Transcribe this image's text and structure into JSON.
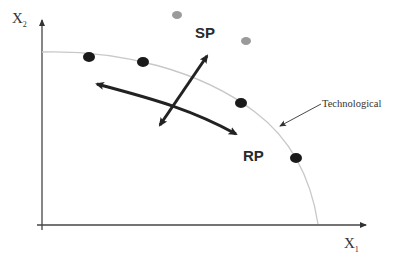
{
  "diagram": {
    "type": "production-possibility-frontier",
    "axes": {
      "x": {
        "label": "X",
        "subscript": "1"
      },
      "y": {
        "label": "X",
        "subscript": "2"
      }
    },
    "frontier": {
      "label": "Technological",
      "color": "#c8c8c8"
    },
    "labels": {
      "sp": "SP",
      "rp": "RP"
    },
    "points": {
      "on_frontier": [
        {
          "x": 89,
          "y": 57
        },
        {
          "x": 143,
          "y": 62
        },
        {
          "x": 240,
          "y": 102
        },
        {
          "x": 295,
          "y": 158
        }
      ],
      "beyond_frontier": [
        {
          "x": 177,
          "y": 15
        },
        {
          "x": 246,
          "y": 41
        }
      ]
    },
    "colors": {
      "axis": "#333333",
      "point_on": "#1a1a1a",
      "point_beyond": "#9a9a9a",
      "arrow": "#222222"
    }
  }
}
